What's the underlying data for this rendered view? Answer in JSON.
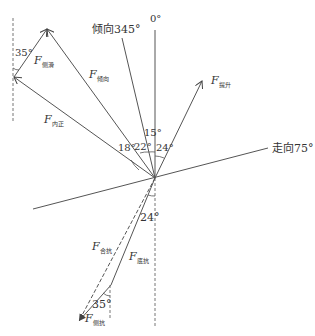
{
  "diagram": {
    "type": "force-vector-diagram",
    "directions": {
      "north": "0°",
      "dip": "倾向345°",
      "strike": "走向75°"
    },
    "forces": {
      "lateral_slide": {
        "symbol": "F",
        "subscript": "侧滑"
      },
      "dip_direction": {
        "symbol": "F",
        "subscript": "倾向"
      },
      "inner": {
        "symbol": "F",
        "subscript": "内正"
      },
      "lift": {
        "symbol": "F",
        "subscript": "提升"
      },
      "combined_resist": {
        "symbol": "F",
        "subscript": "合抗"
      },
      "base_resist": {
        "symbol": "F",
        "subscript": "底抗"
      },
      "lateral_resist": {
        "symbol": "F",
        "subscript": "侧抗"
      }
    },
    "angles": {
      "top_left": "35°",
      "a15": "15°",
      "a18": "18°",
      "a22": "22°",
      "a24_upper": "24°",
      "a24_lower": "24°",
      "bottom": "35°"
    },
    "colors": {
      "line": "#555555",
      "text": "#333333",
      "background": "#ffffff"
    }
  }
}
